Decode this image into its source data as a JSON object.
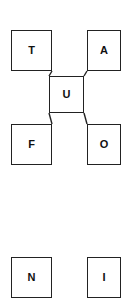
{
  "diagram": {
    "type": "node-link-diagram",
    "canvas": {
      "width": 130,
      "height": 284,
      "background": "#ffffff"
    },
    "style": {
      "node_fill": "#ffffff",
      "node_border": "#222222",
      "node_border_width": 1.4,
      "label_color": "#111111",
      "edge_color": "#222222",
      "edge_width": 1.4
    },
    "nodes": [
      {
        "id": "t",
        "label": "T",
        "x": 11,
        "y": 30,
        "w": 41,
        "h": 41,
        "visible": "full"
      },
      {
        "id": "a",
        "label": "A",
        "x": 87,
        "y": 30,
        "w": 34,
        "h": 41,
        "visible": "clipped-right"
      },
      {
        "id": "u",
        "label": "U",
        "x": 49,
        "y": 76,
        "w": 35,
        "h": 37,
        "visible": "full"
      },
      {
        "id": "f",
        "label": "F",
        "x": 11,
        "y": 124,
        "w": 41,
        "h": 41,
        "visible": "full"
      },
      {
        "id": "o",
        "label": "O",
        "x": 87,
        "y": 124,
        "w": 34,
        "h": 41,
        "visible": "clipped-right"
      },
      {
        "id": "n",
        "label": "N",
        "x": 11,
        "y": 257,
        "w": 41,
        "h": 41,
        "visible": "clipped-bottom"
      },
      {
        "id": "i",
        "label": "I",
        "x": 87,
        "y": 257,
        "w": 34,
        "h": 41,
        "visible": "clipped-bottom-right"
      }
    ],
    "edges": [
      {
        "from": "t",
        "to": "u",
        "x1": 52,
        "y1": 71,
        "x2": 49,
        "y2": 76
      },
      {
        "from": "a",
        "to": "u",
        "x1": 87,
        "y1": 71,
        "x2": 84,
        "y2": 76
      },
      {
        "from": "u",
        "to": "f",
        "x1": 49,
        "y1": 113,
        "x2": 52,
        "y2": 124
      },
      {
        "from": "u",
        "to": "o",
        "x1": 84,
        "y1": 113,
        "x2": 87,
        "y2": 124
      }
    ]
  }
}
